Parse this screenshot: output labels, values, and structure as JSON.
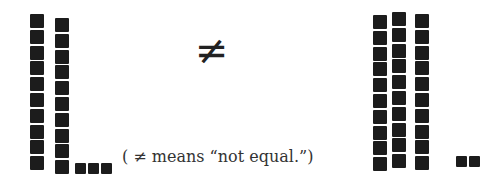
{
  "symbol": "≠",
  "caption": "( ≠ means “not equal.”)",
  "colors": {
    "block": "#1c1c1c",
    "text": "#333333",
    "background": "#ffffff"
  },
  "left_group": {
    "label": "23",
    "tens": 2,
    "ones": 3,
    "rods": [
      {
        "x": 30,
        "y": 14
      },
      {
        "x": 55,
        "y": 18
      }
    ],
    "units": [
      {
        "x": 75,
        "y": 163
      },
      {
        "x": 88,
        "y": 163
      },
      {
        "x": 101,
        "y": 163
      }
    ]
  },
  "right_group": {
    "label": "32",
    "tens": 3,
    "ones": 2,
    "rods": [
      {
        "x": 373,
        "y": 15
      },
      {
        "x": 392,
        "y": 12
      },
      {
        "x": 415,
        "y": 14
      }
    ],
    "units": [
      {
        "x": 456,
        "y": 156
      },
      {
        "x": 469,
        "y": 156
      }
    ]
  }
}
